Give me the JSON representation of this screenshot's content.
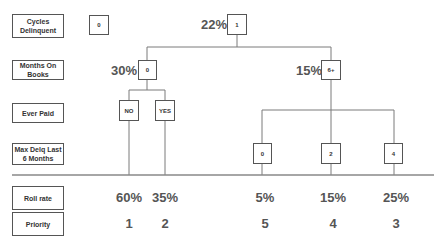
{
  "row_labels": {
    "cycles_delinquent": "Cycles Delinquent",
    "months_on_books": "Months On Books",
    "ever_paid": "Ever Paid",
    "max_delq": "Max Delq Last 6 Months",
    "roll_rate": "Roll rate",
    "priority": "Priority"
  },
  "nodes": {
    "cycles_0": "0",
    "cycles_1": "1",
    "mob_0": "0",
    "mob_6plus": "6+",
    "paid_no": "NO",
    "paid_yes": "YES",
    "delq_0": "0",
    "delq_2": "2",
    "delq_4": "4"
  },
  "node_rates": {
    "cycles_1": "22%",
    "mob_0": "30%",
    "mob_6plus": "15%"
  },
  "leaves": [
    {
      "path": "Cycles 1 / MOB 0 / Ever Paid NO",
      "roll_rate": "60%",
      "priority": "1"
    },
    {
      "path": "Cycles 1 / MOB 0 / Ever Paid YES",
      "roll_rate": "35%",
      "priority": "2"
    },
    {
      "path": "Cycles 1 / MOB 6+ / Max Delq 0",
      "roll_rate": "5%",
      "priority": "5"
    },
    {
      "path": "Cycles 1 / MOB 6+ / Max Delq 2",
      "roll_rate": "15%",
      "priority": "4"
    },
    {
      "path": "Cycles 1 / MOB 6+ / Max Delq 4",
      "roll_rate": "25%",
      "priority": "3"
    }
  ],
  "colors": {
    "line": "#777777",
    "text": "#555555",
    "box_border": "#555555"
  }
}
